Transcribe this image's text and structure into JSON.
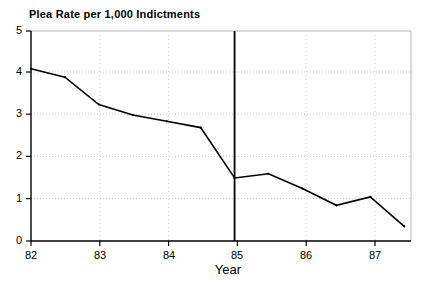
{
  "chart_data": {
    "type": "line",
    "title": "Plea Rate per 1,000 Indictments",
    "xlabel": "Year",
    "ylabel": "",
    "xlim": [
      82,
      87.6
    ],
    "ylim": [
      0,
      5
    ],
    "grid": true,
    "legend": null,
    "xticks": [
      82,
      83,
      84,
      85,
      86,
      87
    ],
    "xtick_labels": [
      "82",
      "83",
      "84",
      "85",
      "86",
      "87"
    ],
    "yticks": [
      0,
      1,
      2,
      3,
      4,
      5
    ],
    "ytick_labels": [
      "0",
      "1",
      "2",
      "3",
      "4",
      "5"
    ],
    "x": [
      82.0,
      82.5,
      83.0,
      83.5,
      84.0,
      84.5,
      85.0,
      85.5,
      86.0,
      86.5,
      87.0,
      87.5
    ],
    "values": [
      4.1,
      3.9,
      3.25,
      3.0,
      2.85,
      2.7,
      1.5,
      1.6,
      1.25,
      0.85,
      1.05,
      0.35
    ],
    "series": [
      {
        "name": "Plea Rate per 1,000 Indictments",
        "values": [
          4.1,
          3.9,
          3.25,
          3.0,
          2.85,
          2.7,
          1.5,
          1.6,
          1.25,
          0.85,
          1.05,
          0.35
        ]
      }
    ],
    "annotations": [
      {
        "name": "intervention-line",
        "type": "vline",
        "x": 85,
        "label": ""
      }
    ],
    "colors": {
      "line": "#000000",
      "axis": "#000000",
      "grid": "#c8c8c8",
      "frame": "#b4b4b4",
      "background": "#ffffff"
    }
  }
}
